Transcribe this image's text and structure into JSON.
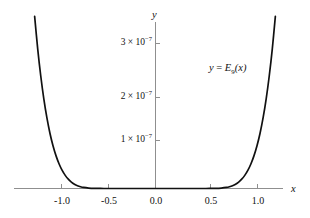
{
  "figure": {
    "background_color": "#ffffff",
    "curve_color": "#111111",
    "axis_color": "#8a8a8a",
    "text_color": "#111111"
  },
  "axes": {
    "x_axis_label": "x",
    "y_axis_label": "y",
    "x_ticks": [
      {
        "value": -1.0,
        "label": "-1.0",
        "px": 61
      },
      {
        "value": -0.5,
        "label": "-0.5",
        "px": 108
      },
      {
        "value": 0.0,
        "label": "0.0",
        "px": 155
      },
      {
        "value": 0.5,
        "label": "0.5",
        "px": 210
      },
      {
        "value": 1.0,
        "label": "1.0",
        "px": 257
      }
    ],
    "y_ticks": [
      {
        "value": 1e-07,
        "mantissa": "1",
        "times": "×",
        "base": "10",
        "exponent": "−7",
        "label": "1 × 10−7",
        "px": 140
      },
      {
        "value": 2e-07,
        "mantissa": "2",
        "times": "×",
        "base": "10",
        "exponent": "−7",
        "label": "2 × 10−7",
        "px": 97
      },
      {
        "value": 3e-07,
        "mantissa": "3",
        "times": "×",
        "base": "10",
        "exponent": "−7",
        "label": "3 × 10−7",
        "px": 43
      }
    ]
  },
  "annotation": {
    "y_symbol": "y",
    "equals": "=",
    "function_symbol": "E",
    "function_index": "9",
    "argument": "(x)",
    "full_text": "y = E9(x)"
  },
  "chart_data": {
    "type": "line",
    "title": "",
    "subtitle": "",
    "xlabel": "x",
    "ylabel": "y",
    "xlim": [
      -1.22,
      1.28
    ],
    "ylim": [
      0,
      3.55e-07
    ],
    "grid": false,
    "legend": null,
    "annotations": [
      {
        "text": "y = E9(x)",
        "x": 0.78,
        "y": 2.55e-07
      }
    ],
    "xticks": [
      -1.0,
      -0.5,
      0.0,
      0.5,
      1.0
    ],
    "xticklabels": [
      "-1.0",
      "-0.5",
      "0.0",
      "0.5",
      "1.0"
    ],
    "yticks": [
      1e-07,
      2e-07,
      3e-07
    ],
    "yticklabels": [
      "1 × 10−7",
      "2 × 10−7",
      "3 × 10−7"
    ],
    "series": [
      {
        "name": "E9(x)",
        "color": "#111111",
        "linewidth": 1.7,
        "x": [
          -1.18,
          -1.15,
          -1.12,
          -1.09,
          -1.06,
          -1.03,
          -1.0,
          -0.97,
          -0.94,
          -0.91,
          -0.88,
          -0.85,
          -0.82,
          -0.79,
          -0.76,
          -0.73,
          -0.7,
          -0.65,
          -0.6,
          -0.5,
          -0.4,
          -0.3,
          -0.2,
          -0.1,
          0.0,
          0.1,
          0.2,
          0.3,
          0.4,
          0.5,
          0.6,
          0.65,
          0.7,
          0.73,
          0.76,
          0.79,
          0.82,
          0.85,
          0.88,
          0.91,
          0.94,
          0.97,
          1.0,
          1.03,
          1.06,
          1.09,
          1.12,
          1.15,
          1.18
        ],
        "y": [
          3.55e-07,
          2.88e-07,
          2.32e-07,
          1.85e-07,
          1.46e-07,
          1.14e-07,
          8.82e-08,
          6.73e-08,
          5.06e-08,
          3.74e-08,
          2.71e-08,
          1.92e-08,
          1.33e-08,
          8.92e-09,
          5.79e-09,
          3.62e-09,
          2.17e-09,
          9.4e-10,
          3.7e-10,
          4.2e-11,
          3e-12,
          1e-13,
          1.5e-15,
          1.5e-18,
          0.0,
          1.5e-18,
          1.5e-15,
          1e-13,
          3e-12,
          4.2e-11,
          3.7e-10,
          9.4e-10,
          2.17e-09,
          3.62e-09,
          5.79e-09,
          8.92e-09,
          1.33e-08,
          1.92e-08,
          2.71e-08,
          3.74e-08,
          5.06e-08,
          6.73e-08,
          8.82e-08,
          1.14e-07,
          1.46e-07,
          1.85e-07,
          2.32e-07,
          2.88e-07,
          3.55e-07
        ]
      }
    ]
  }
}
